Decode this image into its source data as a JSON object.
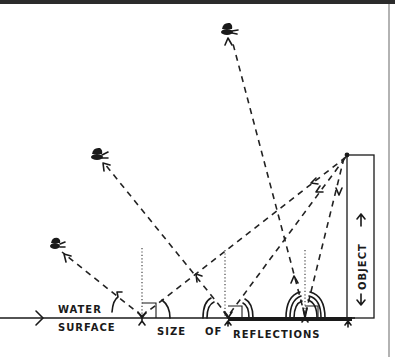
{
  "diagram": {
    "title_band_color": "#2b2b2b",
    "ink_color": "#1a1a1a",
    "labels": {
      "water": "WATER",
      "surface": "SURFACE",
      "size": "SIZE",
      "of": "OF",
      "reflections": "REFLECTIONS",
      "object": "OBJECT"
    },
    "observers": [
      {
        "name": "high-eye",
        "x": 228,
        "y": 30
      },
      {
        "name": "middle-eye",
        "x": 98,
        "y": 157
      },
      {
        "name": "low-eye",
        "x": 57,
        "y": 246
      }
    ],
    "object": {
      "x": 347,
      "y": 155,
      "width": 27,
      "height": 163
    },
    "water_surface_y": 318,
    "reflection_points": [
      {
        "x": 142,
        "size": "small"
      },
      {
        "x": 228,
        "size": "medium"
      },
      {
        "x": 305,
        "size": "large"
      }
    ],
    "icons": [
      "eye-icon",
      "arrow-icon",
      "reflection-arc-icon"
    ]
  }
}
